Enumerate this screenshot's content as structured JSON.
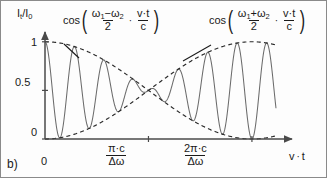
{
  "figure": {
    "panel_label": "b)",
    "background": "#fdfdfd",
    "curve_color": "#6b6b6b",
    "envelope_color": "#2a2a2a",
    "axis_color": "#4a4a4a"
  },
  "axes": {
    "y_title": "I",
    "y_title_sub1": "t",
    "y_title_mid": "/I",
    "y_title_sub2": "0",
    "x_title": "v",
    "x_title_dot": "·",
    "x_title_2": "t",
    "y_ticks": [
      "1",
      "0.5",
      "0"
    ],
    "y_tick_values": [
      1,
      0.5,
      0
    ],
    "x_origin_label": "0",
    "x_ticks": [
      {
        "num": "π·c",
        "den": "Δω",
        "value": 3.141592653589793
      },
      {
        "num": "2π·c",
        "den": "Δω",
        "value": 6.283185307179586
      }
    ]
  },
  "annotations": [
    {
      "name": "envelope-formula",
      "cos": "cos",
      "open": "(",
      "close": ")",
      "num": "ω",
      "num_sub1": "1",
      "num_op": "−",
      "num_w2": "ω",
      "num_sub2": "2",
      "den": "2",
      "dot": "·",
      "num2": "v·t",
      "den2": "c"
    },
    {
      "name": "carrier-formula",
      "cos": "cos",
      "open": "(",
      "close": ")",
      "num": "ω",
      "num_sub1": "1",
      "num_op": "+",
      "num_w2": "ω",
      "num_sub2": "2",
      "den": "2",
      "dot": "·",
      "num2": "v·t",
      "den2": "c"
    }
  ],
  "chart_data": {
    "type": "line",
    "title": "",
    "xlabel": "v·t",
    "ylabel": "I_t/I_0",
    "xlim": [
      0,
      7.5
    ],
    "ylim": [
      0,
      1.08
    ],
    "grid": false,
    "legend": null,
    "x_tick_values": [
      0,
      3.141592653589793,
      6.283185307179586
    ],
    "x_tick_labels": [
      "0",
      "π·c/Δω",
      "2π·c/Δω"
    ],
    "y_tick_values": [
      0,
      0.5,
      1
    ],
    "y_tick_labels": [
      "0",
      "0.5",
      "1"
    ],
    "carrier_frequency": 7.0,
    "envelope_frequency": 0.5,
    "series": [
      {
        "name": "intensity",
        "style": "solid",
        "color": "#6b6b6b",
        "formula": "0.5 + 0.5*cos(w_env*x)*cos(w_car*x)"
      },
      {
        "name": "upper-envelope",
        "style": "dashed",
        "color": "#2a2a2a",
        "formula": "0.5 + 0.5*cos(w_env*x)"
      },
      {
        "name": "lower-envelope",
        "style": "dashed",
        "color": "#2a2a2a",
        "formula": "0.5 - 0.5*cos(w_env*x)"
      }
    ]
  }
}
